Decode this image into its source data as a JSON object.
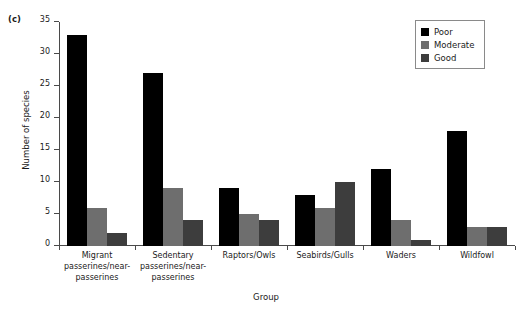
{
  "panel": {
    "label": "(c)"
  },
  "chart_data": {
    "type": "bar",
    "title": "",
    "subtitle": "",
    "xlabel": "Group",
    "ylabel": "Number of species",
    "ylim": [
      0,
      35
    ],
    "yticks": [
      0,
      5,
      10,
      15,
      20,
      25,
      30,
      35
    ],
    "grid": false,
    "legend_position": "top-right",
    "categories": [
      "Migrant passerines/near-passerines",
      "Sedentary passerines/near-passerines",
      "Raptors/Owls",
      "Seabirds/Gulls",
      "Waders",
      "Wildfowl"
    ],
    "series": [
      {
        "name": "Poor",
        "color": "#000000",
        "values": [
          33,
          27,
          9,
          8,
          12,
          18
        ]
      },
      {
        "name": "Moderate",
        "color": "#6e6e6e",
        "values": [
          6,
          9,
          5,
          6,
          4,
          3
        ]
      },
      {
        "name": "Good",
        "color": "#3d3d3d",
        "values": [
          2,
          4,
          4,
          10,
          1,
          3
        ]
      }
    ]
  },
  "axis": {
    "y_title": "Number of species",
    "x_title": "Group",
    "y_tick_labels": [
      "0",
      "5",
      "10",
      "15",
      "20",
      "25",
      "30",
      "35"
    ]
  },
  "x_category_lines": [
    [
      "Migrant",
      "passerines/near-",
      "passerines"
    ],
    [
      "Sedentary",
      "passerines/near-",
      "passerines"
    ],
    [
      "Raptors/Owls"
    ],
    [
      "Seabirds/Gulls"
    ],
    [
      "Waders"
    ],
    [
      "Wildfowl"
    ]
  ],
  "legend": {
    "items": [
      {
        "label": "Poor",
        "color": "#000000"
      },
      {
        "label": "Moderate",
        "color": "#6e6e6e"
      },
      {
        "label": "Good",
        "color": "#3d3d3d"
      }
    ]
  }
}
